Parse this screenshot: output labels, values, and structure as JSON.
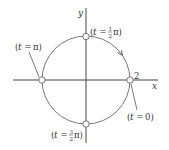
{
  "diagram": {
    "axes": {
      "x_label": "x",
      "y_label": "y"
    },
    "circle": {
      "radius_label": "2",
      "direction": "counterclockwise"
    },
    "points": [
      {
        "id": "t0",
        "param": "t",
        "eq": "=",
        "value": "0",
        "label_text": "(t = 0)"
      },
      {
        "id": "t_half_pi",
        "param": "t",
        "eq": "=",
        "value_num": "1",
        "value_den": "2",
        "value_suffix": "π",
        "label_text": "(t = 1/2 π)"
      },
      {
        "id": "t_pi",
        "param": "t",
        "eq": "=",
        "value": "π",
        "label_text": "(t = π)"
      },
      {
        "id": "t_three_half_pi",
        "param": "t",
        "eq": "=",
        "value_num": "3",
        "value_den": "2",
        "value_suffix": "π",
        "label_text": "(t = 3/2 π)"
      }
    ],
    "colors": {
      "stroke": "#555555",
      "axis": "#444444",
      "point_fill": "#ffffff",
      "text": "#333333"
    }
  }
}
